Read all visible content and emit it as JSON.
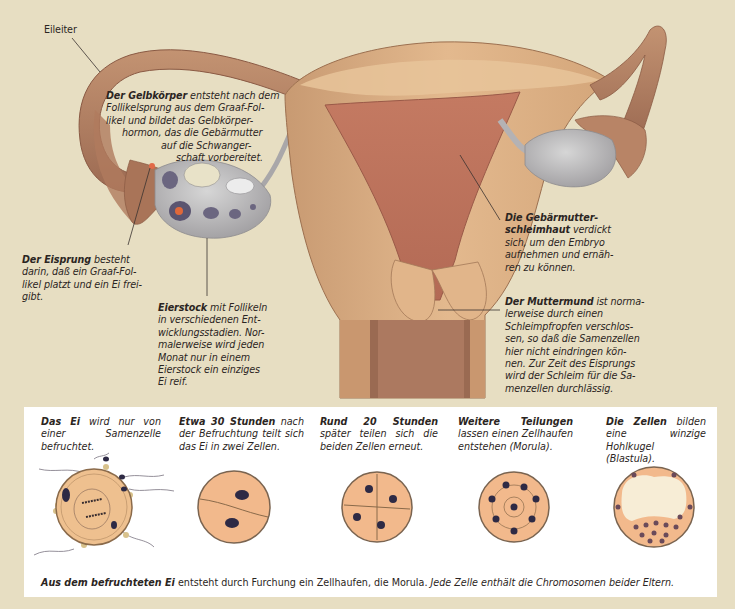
{
  "figure": {
    "colors": {
      "background": "#e7dec2",
      "uterus_wall": "#dcae82",
      "uterus_lining": "#b8705a",
      "tube": "#b88664",
      "ovary": "#b9b8b8",
      "panel": "#ffffff",
      "cell": "#f2b98c",
      "nucleus": "#2e2a45"
    }
  },
  "labels": {
    "eileiter": "Eileiter",
    "gelbkoerper": {
      "bold": "Der Gelbkörper",
      "lines": [
        "entsteht nach dem",
        "Follikelsprung aus dem Graaf-Fol-",
        "likel und bildet das Gelbkörper-",
        "hormon, das die Gebärmutter",
        "auf die Schwanger-",
        "schaft vorbereitet."
      ]
    },
    "eisprung": {
      "bold": "Der Eisprung",
      "lines": [
        "besteht",
        "darin, daß ein Graaf-Fol-",
        "likel platzt und ein Ei frei-",
        "gibt."
      ]
    },
    "eierstock": {
      "bold": "Eierstock",
      "lines": [
        "mit Follikeln",
        "in verschiedenen Ent-",
        "wicklungsstadien. Nor-",
        "malerweise wird jeden",
        "Monat nur in einem",
        "Eierstock ein einziges",
        "Ei reif."
      ]
    },
    "schleimhaut": {
      "bold1": "Die Gebärmutter-",
      "bold2": "schleimhaut",
      "lines": [
        "verdickt",
        "sich, um den Embryo",
        "aufnehmen und ernäh-",
        "ren zu können."
      ]
    },
    "muttermund": {
      "bold": "Der Muttermund",
      "lines": [
        "ist norma-",
        "lerweise durch einen",
        "Schleimpfropfen verschlos-",
        "sen, so daß die Samenzellen",
        "hier nicht eindringen kön-",
        "nen. Zur Zeit des Eisprungs",
        "wird der Schleim für die Sa-",
        "menzellen durchlässig."
      ]
    }
  },
  "stages": [
    {
      "bold": "Das Ei",
      "text": "wird nur von einer Samenzelle befruchtet."
    },
    {
      "bold": "Etwa 30 Stunden",
      "text": "nach der Befruchtung teilt sich das Ei in zwei Zellen."
    },
    {
      "bold": "Rund 20 Stunden",
      "text": "später teilen sich die beiden Zellen erneut."
    },
    {
      "bold": "Weitere Teilungen",
      "text": "lassen einen Zellhaufen entstehen (Morula)."
    },
    {
      "bold": "Die Zellen",
      "text": "bilden eine winzige Hohlkugel (Blastula)."
    }
  ],
  "caption": {
    "bold": "Aus dem befruchteten Ei",
    "upright": "entsteht durch Furchung ein Zellhaufen, die Morula.",
    "italic": "Jede Zelle enthält die Chromosomen beider Eltern."
  }
}
